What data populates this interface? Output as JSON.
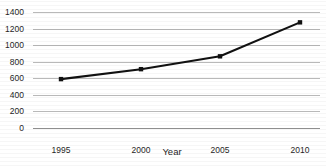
{
  "chart_data": {
    "type": "line",
    "title": "",
    "xlabel": "Year",
    "ylabel": "",
    "categories": [
      "1995",
      "2000",
      "2005",
      "2010"
    ],
    "x": [
      1995,
      2000,
      2005,
      2010
    ],
    "values": [
      590,
      710,
      865,
      1275
    ],
    "series": [
      {
        "name": "",
        "values": [
          590,
          710,
          865,
          1275
        ]
      }
    ],
    "ylim": [
      0,
      1400
    ],
    "xlim": [
      1993,
      2012
    ],
    "yticks": [
      0,
      200,
      400,
      600,
      800,
      1000,
      1200,
      1400
    ],
    "ytick_labels": [
      "0",
      "200",
      "400",
      "600",
      "800",
      "1000",
      "1200",
      "1400"
    ],
    "xticks": [
      1995,
      2000,
      2005,
      2010
    ],
    "xtick_labels": [
      "1995",
      "2000",
      "2005",
      "2010"
    ],
    "grid": "horizontal",
    "legend": "none",
    "marker": "square",
    "line_color": "#111111",
    "marker_color": "#111111",
    "grid_color": "#b9b9b9",
    "background_color": "#ffffff"
  },
  "figure": {
    "title_text": "",
    "axis_label_x": "Year"
  }
}
